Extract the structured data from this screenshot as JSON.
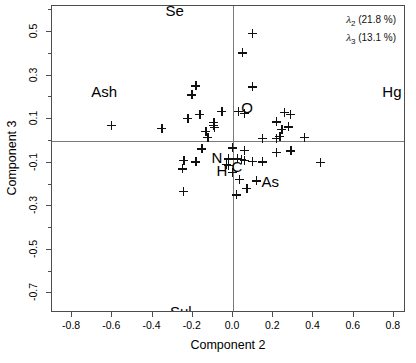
{
  "chart_data": {
    "type": "scatter",
    "title": "",
    "xlabel": "Component 2",
    "ylabel": "Component 3",
    "xlim": [
      -0.9,
      0.86
    ],
    "ylim": [
      -0.79,
      0.62
    ],
    "xticks": [
      -0.8,
      -0.6,
      -0.4,
      -0.2,
      0.0,
      0.2,
      0.4,
      0.6,
      0.8
    ],
    "xticklabels": [
      "-0.8",
      "-0.6",
      "-0.4",
      "-0.2",
      "0.0",
      "0.2",
      "0.4",
      "0.6",
      "0.8"
    ],
    "yticks": [
      0.5,
      0.3,
      0.1,
      -0.1,
      -0.3,
      -0.5,
      -0.7
    ],
    "yticklabels": [
      "0.5",
      "0.3",
      "0.1",
      "-0.1",
      "-0.3",
      "-0.5",
      "-0.7"
    ],
    "minor_xticks": [
      -0.7,
      -0.5,
      -0.3,
      -0.1,
      0.1,
      0.3,
      0.5,
      0.7
    ],
    "minor_yticks": [
      0.6,
      0.4,
      0.2,
      0.0,
      -0.2,
      -0.4,
      -0.6
    ],
    "grid": false,
    "zero_lines": {
      "x": 0.0,
      "y": 0.0
    },
    "marker": "plus",
    "marker_color": "#111111",
    "frame_color": "#4d4d4d",
    "zero_line_color": "#7a7a7a",
    "legend_position": "top-right",
    "legend": [
      {
        "symbol": "λ",
        "subscript": "2",
        "text": "(21.8 %)",
        "value": 21.8
      },
      {
        "symbol": "λ",
        "subscript": "3",
        "text": "(13.1 %)",
        "value": 13.1
      }
    ],
    "annotations": [
      {
        "label": "Se",
        "x": -0.29,
        "y": 0.6
      },
      {
        "label": "Ash",
        "x": -0.64,
        "y": 0.23
      },
      {
        "label": "Hg",
        "x": 0.79,
        "y": 0.23
      },
      {
        "label": "Sul",
        "x": -0.26,
        "y": -0.78
      },
      {
        "label": "O",
        "x": 0.07,
        "y": 0.155
      },
      {
        "label": "N",
        "x": -0.08,
        "y": -0.075
      },
      {
        "label": "C",
        "x": 0.02,
        "y": -0.115
      },
      {
        "label": "H",
        "x": -0.055,
        "y": -0.135
      },
      {
        "label": "As",
        "x": 0.185,
        "y": -0.185
      }
    ],
    "points": [
      {
        "x": 0.095,
        "y": 0.495
      },
      {
        "x": 0.045,
        "y": 0.405
      },
      {
        "x": -0.185,
        "y": 0.253
      },
      {
        "x": 0.095,
        "y": 0.248
      },
      {
        "x": -0.205,
        "y": 0.213
      },
      {
        "x": -0.165,
        "y": 0.122
      },
      {
        "x": 0.025,
        "y": 0.135
      },
      {
        "x": -0.055,
        "y": 0.135
      },
      {
        "x": -0.225,
        "y": 0.103
      },
      {
        "x": 0.055,
        "y": 0.128
      },
      {
        "x": 0.285,
        "y": 0.122
      },
      {
        "x": 0.255,
        "y": 0.132
      },
      {
        "x": -0.605,
        "y": 0.072
      },
      {
        "x": -0.355,
        "y": 0.058
      },
      {
        "x": -0.095,
        "y": 0.085
      },
      {
        "x": -0.095,
        "y": 0.072
      },
      {
        "x": -0.092,
        "y": 0.062
      },
      {
        "x": 0.215,
        "y": 0.088
      },
      {
        "x": 0.275,
        "y": 0.065
      },
      {
        "x": 0.242,
        "y": 0.055
      },
      {
        "x": -0.135,
        "y": 0.045
      },
      {
        "x": -0.125,
        "y": 0.018
      },
      {
        "x": 0.145,
        "y": 0.012
      },
      {
        "x": 0.215,
        "y": 0.012
      },
      {
        "x": 0.232,
        "y": 0.022
      },
      {
        "x": 0.355,
        "y": 0.018
      },
      {
        "x": -0.155,
        "y": -0.035
      },
      {
        "x": -0.005,
        "y": -0.032
      },
      {
        "x": 0.055,
        "y": -0.042
      },
      {
        "x": 0.288,
        "y": -0.045
      },
      {
        "x": 0.215,
        "y": -0.052
      },
      {
        "x": -0.245,
        "y": -0.088
      },
      {
        "x": -0.185,
        "y": -0.095
      },
      {
        "x": -0.022,
        "y": -0.082
      },
      {
        "x": 0.022,
        "y": -0.082
      },
      {
        "x": 0.042,
        "y": -0.085
      },
      {
        "x": 0.055,
        "y": -0.088
      },
      {
        "x": 0.095,
        "y": -0.092
      },
      {
        "x": 0.145,
        "y": -0.095
      },
      {
        "x": 0.435,
        "y": -0.098
      },
      {
        "x": -0.032,
        "y": -0.108
      },
      {
        "x": -0.022,
        "y": -0.112
      },
      {
        "x": -0.252,
        "y": -0.128
      },
      {
        "x": -0.005,
        "y": -0.145
      },
      {
        "x": 0.032,
        "y": -0.175
      },
      {
        "x": 0.115,
        "y": -0.182
      },
      {
        "x": -0.248,
        "y": -0.232
      },
      {
        "x": 0.068,
        "y": -0.218
      },
      {
        "x": 0.015,
        "y": -0.248
      }
    ]
  }
}
